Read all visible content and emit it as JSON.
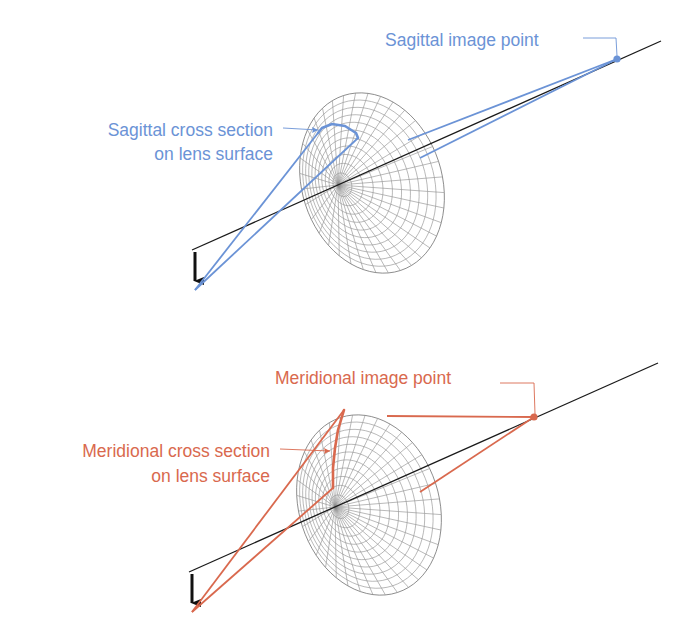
{
  "colors": {
    "sagittal": "#6b93d6",
    "meridional": "#d9694e",
    "axis": "#1a1a1a",
    "mesh": "#8a8a8a",
    "object_arrow": "#111111"
  },
  "panels": [
    {
      "id": "sagittal",
      "color_key": "sagittal",
      "image_point_label": "Sagittal image point",
      "cross_section_label_line1": "Sagittal cross section",
      "cross_section_label_line2": "on lens surface",
      "geometry": {
        "axis": [
          [
            192,
            250
          ],
          [
            661,
            41
          ]
        ],
        "object_arrow": {
          "from": [
            195,
            252
          ],
          "to": [
            195,
            290
          ]
        },
        "lens_pole": [
          338,
          185
        ],
        "lens_rim": {
          "cx": 372,
          "cy": 183,
          "rx": 70,
          "ry": 92,
          "rot": -18
        },
        "image_point": [
          617,
          59
        ],
        "rays_front": [
          [
            [
              195,
              290
            ],
            [
              318,
              133
            ]
          ],
          [
            [
              195,
              290
            ],
            [
              358,
              138
            ]
          ]
        ],
        "cross_section": [
          [
            318,
            133
          ],
          [
            322,
            128
          ],
          [
            332,
            124
          ],
          [
            345,
            126
          ],
          [
            356,
            133
          ],
          [
            358,
            138
          ]
        ],
        "rays_back": [
          [
            [
              408,
              140
            ],
            [
              617,
              59
            ]
          ],
          [
            [
              420,
              158
            ],
            [
              617,
              59
            ]
          ]
        ],
        "image_label_pos": [
          385,
          46
        ],
        "image_leader": [
          [
            583,
            38
          ],
          [
            616,
            38
          ],
          [
            617,
            56
          ]
        ],
        "xsec_label_pos": [
          273,
          136
        ],
        "xsec_label2_pos": [
          273,
          160
        ],
        "xsec_leader": [
          [
            283,
            128
          ],
          [
            318,
            130
          ]
        ]
      }
    },
    {
      "id": "meridional",
      "color_key": "meridional",
      "image_point_label": "Meridional image point",
      "cross_section_label_line1": "Meridional cross section",
      "cross_section_label_line2": "on lens surface",
      "geometry": {
        "axis": [
          [
            189,
            572
          ],
          [
            658,
            363
          ]
        ],
        "object_arrow": {
          "from": [
            192,
            574
          ],
          "to": [
            192,
            612
          ]
        },
        "lens_pole": [
          335,
          507
        ],
        "lens_rim": {
          "cx": 369,
          "cy": 505,
          "rx": 70,
          "ry": 92,
          "rot": -18
        },
        "image_point": [
          534,
          417
        ],
        "rays_front": [
          [
            [
              192,
              612
            ],
            [
              344,
              410
            ]
          ],
          [
            [
              192,
              612
            ],
            [
              333,
              488
            ]
          ]
        ],
        "cross_section": [
          [
            344,
            410
          ],
          [
            338,
            430
          ],
          [
            335,
            448
          ],
          [
            333,
            468
          ],
          [
            333,
            488
          ]
        ],
        "rays_back": [
          [
            [
              387,
              416
            ],
            [
              534,
              417
            ]
          ],
          [
            [
              420,
              492
            ],
            [
              534,
              417
            ]
          ]
        ],
        "image_label_pos": [
          275,
          384
        ],
        "image_leader": [
          [
            500,
            383
          ],
          [
            534,
            383
          ],
          [
            535,
            414
          ]
        ],
        "xsec_label_pos": [
          270,
          457
        ],
        "xsec_label2_pos": [
          270,
          482
        ],
        "xsec_leader": [
          [
            280,
            449
          ],
          [
            330,
            451
          ]
        ]
      }
    }
  ]
}
